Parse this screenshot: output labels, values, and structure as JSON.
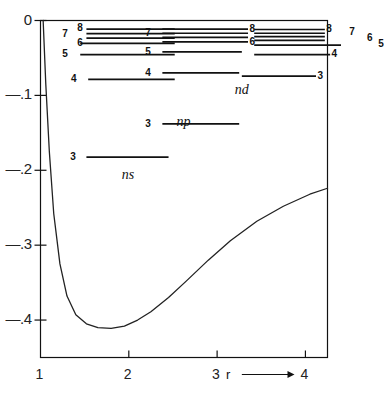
{
  "chart_data": {
    "type": "line",
    "title": "",
    "xlabel": "r",
    "ylabel": "",
    "xlim": [
      1,
      4.25
    ],
    "ylim": [
      -0.45,
      0.0
    ],
    "grid": false,
    "legend": false,
    "axes": {
      "x_ticks": [
        "1",
        "2",
        "3",
        "4"
      ],
      "x_tick_values": [
        1,
        2,
        3,
        4
      ],
      "y_ticks": [
        "0",
        "—.1",
        "—.2",
        "—.3",
        "—.4"
      ],
      "y_tick_values": [
        0.0,
        -0.1,
        -0.2,
        -0.3,
        -0.4
      ],
      "x_axis_arrow_label": "r ⟶"
    },
    "series": [
      {
        "name": "potential-energy-curve",
        "type": "line",
        "x": [
          1.03,
          1.06,
          1.1,
          1.15,
          1.22,
          1.3,
          1.4,
          1.52,
          1.65,
          1.8,
          1.95,
          2.1,
          2.25,
          2.45,
          2.65,
          2.9,
          3.15,
          3.45,
          3.75,
          4.05,
          4.25
        ],
        "y": [
          0.0,
          -0.085,
          -0.175,
          -0.258,
          -0.325,
          -0.368,
          -0.393,
          -0.405,
          -0.41,
          -0.411,
          -0.408,
          -0.4,
          -0.389,
          -0.37,
          -0.348,
          -0.32,
          -0.294,
          -0.268,
          -0.248,
          -0.232,
          -0.224
        ]
      }
    ],
    "level_groups": [
      {
        "name": "ns",
        "label": "ns",
        "label_x": 2.0,
        "label_y": -0.208,
        "levels": [
          {
            "n": "8",
            "energy": -0.0115,
            "x0": 1.52,
            "x1": 2.52,
            "label_side": "left",
            "label_x": 1.45,
            "label_y": -0.0105
          },
          {
            "n": "7",
            "energy": -0.0175,
            "x0": 1.52,
            "x1": 2.52,
            "label_side": "far-left",
            "label_x": 1.28,
            "label_y": -0.0178
          },
          {
            "n": "",
            "energy": -0.0235,
            "x0": 1.52,
            "x1": 2.52,
            "label_side": "none",
            "label_x": 0,
            "label_y": 0
          },
          {
            "n": "6",
            "energy": -0.0305,
            "x0": 1.45,
            "x1": 2.52,
            "label_side": "left",
            "label_x": 1.45,
            "label_y": -0.0298
          },
          {
            "n": "5",
            "energy": -0.0455,
            "x0": 1.45,
            "x1": 2.52,
            "label_side": "far-left",
            "label_x": 1.28,
            "label_y": -0.0452
          },
          {
            "n": "4",
            "energy": -0.0785,
            "x0": 1.54,
            "x1": 2.52,
            "label_side": "far-left",
            "label_x": 1.38,
            "label_y": -0.0782
          },
          {
            "n": "3",
            "energy": -0.1825,
            "x0": 1.52,
            "x1": 2.45,
            "label_side": "far-left",
            "label_x": 1.37,
            "label_y": -0.1822
          }
        ]
      },
      {
        "name": "np",
        "label": "np",
        "label_x": 2.62,
        "label_y": -0.137,
        "levels": [
          {
            "n": "8",
            "energy": -0.0115,
            "x0": 2.38,
            "x1": 3.35,
            "label_side": "right",
            "label_x": 3.4,
            "label_y": -0.0108
          },
          {
            "n": "7",
            "energy": -0.017,
            "x0": 2.38,
            "x1": 3.35,
            "label_side": "far-left",
            "label_x": 2.22,
            "label_y": -0.0172
          },
          {
            "n": "",
            "energy": -0.0225,
            "x0": 2.38,
            "x1": 3.35,
            "label_side": "none",
            "label_x": 0,
            "label_y": 0
          },
          {
            "n": "6",
            "energy": -0.0285,
            "x0": 2.38,
            "x1": 3.35,
            "label_side": "right",
            "label_x": 3.4,
            "label_y": -0.0282
          },
          {
            "n": "5",
            "energy": -0.042,
            "x0": 2.38,
            "x1": 3.28,
            "label_side": "far-left",
            "label_x": 2.22,
            "label_y": -0.0418
          },
          {
            "n": "4",
            "energy": -0.07,
            "x0": 2.38,
            "x1": 3.25,
            "label_side": "far-left",
            "label_x": 2.22,
            "label_y": -0.0698
          },
          {
            "n": "3",
            "energy": -0.138,
            "x0": 2.38,
            "x1": 3.25,
            "label_side": "far-left",
            "label_x": 2.22,
            "label_y": -0.1378
          }
        ]
      },
      {
        "name": "nd",
        "label": "nd",
        "label_x": 3.28,
        "label_y": -0.0945,
        "levels": [
          {
            "n": "8",
            "energy": -0.012,
            "x0": 3.42,
            "x1": 4.22,
            "label_side": "right",
            "label_x": 4.27,
            "label_y": -0.0118
          },
          {
            "n": "7",
            "energy": -0.017,
            "x0": 3.42,
            "x1": 4.22,
            "label_side": "right",
            "label_x": 4.53,
            "label_y": -0.0155
          },
          {
            "n": "",
            "energy": -0.0215,
            "x0": 3.42,
            "x1": 4.22,
            "label_side": "none",
            "label_x": 0,
            "label_y": 0
          },
          {
            "n": "6",
            "energy": -0.0265,
            "x0": 3.42,
            "x1": 4.22,
            "label_side": "right",
            "label_x": 4.73,
            "label_y": -0.0238
          },
          {
            "n": "5",
            "energy": -0.033,
            "x0": 3.42,
            "x1": 4.48,
            "label_side": "right",
            "label_x": 4.86,
            "label_y": -0.0318
          },
          {
            "n": "4",
            "energy": -0.0455,
            "x0": 3.42,
            "x1": 4.28,
            "label_side": "right",
            "label_x": 4.33,
            "label_y": -0.0452
          },
          {
            "n": "3",
            "energy": -0.0742,
            "x0": 3.28,
            "x1": 4.12,
            "label_side": "right",
            "label_x": 4.17,
            "label_y": -0.074
          }
        ]
      }
    ]
  }
}
